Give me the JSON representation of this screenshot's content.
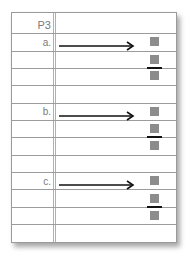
{
  "page": {
    "title": "P3",
    "items": [
      {
        "label": "a.",
        "arrow": "right-arrow",
        "fraction": {
          "numerator": "box",
          "denominator": "box",
          "whole": "box"
        }
      },
      {
        "label": "b.",
        "arrow": "right-arrow",
        "fraction": {
          "numerator": "box",
          "denominator": "box",
          "whole": "box"
        }
      },
      {
        "label": "c.",
        "arrow": "right-arrow",
        "fraction": {
          "numerator": "box",
          "denominator": "box",
          "whole": "box"
        }
      }
    ]
  },
  "colors": {
    "rule_line": "#9c9c9c",
    "margin_line": "#b0b0b0",
    "label_text": "#7a7a7a",
    "answer_box": "#8c8c8c",
    "arrow": "#111111"
  }
}
